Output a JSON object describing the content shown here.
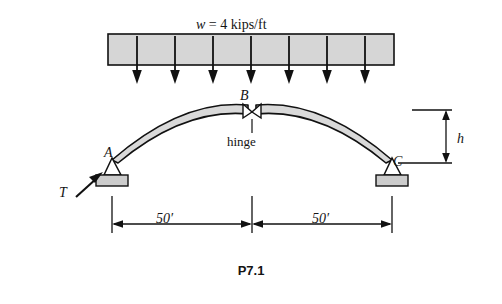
{
  "figure": {
    "caption": "P7.1",
    "labels": {
      "load": "w = 4 kips/ft",
      "load_symbol": "w",
      "load_equals": " = 4 kips/ft",
      "support_A": "A",
      "hinge_B": "B",
      "support_C": "C",
      "tension_T": "T",
      "rise_h": "h",
      "hinge_note": "hinge",
      "span_left": "50′",
      "span_right": "50′"
    },
    "colors": {
      "line": "#111111",
      "arch_fill": "#d9d9d9",
      "load_block_fill": "#d4d4d4",
      "support_fill": "#cccccc",
      "background": "#ffffff"
    },
    "geometry": {
      "load_block": {
        "x": 108,
        "y": 34,
        "width": 286,
        "height": 31
      },
      "load_arrow_count": 7,
      "arch": {
        "left_x": 112,
        "right_x": 392,
        "base_y": 160,
        "apex_x": 252,
        "apex_y": 106
      },
      "dimension_line_y": 224,
      "rise_marker_x": 446,
      "rise_top_y": 110,
      "rise_bottom_y": 163
    }
  }
}
